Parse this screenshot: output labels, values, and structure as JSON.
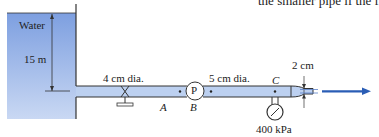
{
  "top_text": "the smaller pipe if the f",
  "tank": {
    "label": "Water",
    "height_label": "15 m",
    "fill_color": "#8fb0e6"
  },
  "pipe1": {
    "label": "4 cm dia."
  },
  "pipe2": {
    "label": "5 cm dia."
  },
  "pump": {
    "label": "P"
  },
  "points": {
    "a": "A",
    "b": "B",
    "c": "C"
  },
  "nozzle": {
    "label": "2 cm"
  },
  "gauge": {
    "label": "400 kPa"
  },
  "colors": {
    "pipe_fill": "#bcd0f0",
    "jet_arrow": "#2a5db5",
    "outline": "#333333"
  }
}
